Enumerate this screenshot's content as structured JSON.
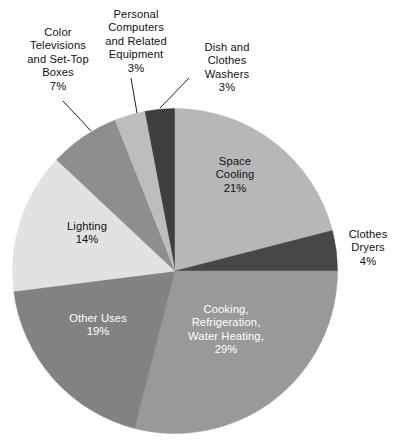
{
  "chart_data": {
    "type": "pie",
    "title": "",
    "subtitle": "",
    "xlabel": "",
    "ylabel": "",
    "legend_position": "none",
    "grid": false,
    "unit": "%",
    "total": 100,
    "categories": [
      "Dish and Clothes Washers",
      "Space Cooling",
      "Clothes Dryers",
      "Cooking, Refrigeration, Water Heating,",
      "Other Uses",
      "Lighting",
      "Color Televisions and Set-Top Boxes",
      "Personal Computers and Related Equipment"
    ],
    "values": [
      3,
      21,
      4,
      29,
      19,
      14,
      7,
      3
    ],
    "slices": [
      {
        "name": "dish-and-clothes-washers",
        "value": 3,
        "value_label": "3%",
        "color": "#3f3f3f",
        "label_lines": [
          "Dish and",
          "Clothes",
          "Washers",
          "3%"
        ],
        "label_placement": "external",
        "text_color": "#111111"
      },
      {
        "name": "space-cooling",
        "value": 21,
        "value_label": "21%",
        "color": "#b7b7b7",
        "label_lines": [
          "Space",
          "Cooling",
          "21%"
        ],
        "label_placement": "internal",
        "text_color": "#111111"
      },
      {
        "name": "clothes-dryers",
        "value": 4,
        "value_label": "4%",
        "color": "#474747",
        "label_lines": [
          "Clothes",
          "Dryers",
          "4%"
        ],
        "label_placement": "external",
        "text_color": "#111111"
      },
      {
        "name": "cooking-refrigeration-water-heating",
        "value": 29,
        "value_label": "29%",
        "color": "#999999",
        "label_lines": [
          "Cooking,",
          "Refrigeration,",
          "Water Heating,",
          "29%"
        ],
        "label_placement": "internal",
        "text_color": "#ffffff"
      },
      {
        "name": "other-uses",
        "value": 19,
        "value_label": "19%",
        "color": "#828282",
        "label_lines": [
          "Other Uses",
          "19%"
        ],
        "label_placement": "internal",
        "text_color": "#ffffff"
      },
      {
        "name": "lighting",
        "value": 14,
        "value_label": "14%",
        "color": "#e2e2e2",
        "label_lines": [
          "Lighting",
          "14%"
        ],
        "label_placement": "internal",
        "text_color": "#111111"
      },
      {
        "name": "color-televisions-and-set-top-boxes",
        "value": 7,
        "value_label": "7%",
        "color": "#8e8e8e",
        "label_lines": [
          "Color",
          "Televisions",
          "and Set-Top",
          "Boxes",
          "7%"
        ],
        "label_placement": "external",
        "text_color": "#111111"
      },
      {
        "name": "personal-computers-and-related-equipment",
        "value": 3,
        "value_label": "3%",
        "color": "#bdbdbd",
        "label_lines": [
          "Personal",
          "Computers",
          "and Related",
          "Equipment",
          "3%"
        ],
        "label_placement": "external",
        "text_color": "#111111"
      }
    ]
  },
  "labels": {
    "color_televisions": {
      "l1": "Color",
      "l2": "Televisions",
      "l3": "and Set-Top",
      "l4": "Boxes",
      "l5": "7%"
    },
    "personal_computers": {
      "l1": "Personal",
      "l2": "Computers",
      "l3": "and Related",
      "l4": "Equipment",
      "l5": "3%"
    },
    "dish_washers": {
      "l1": "Dish and",
      "l2": "Clothes",
      "l3": "Washers",
      "l4": "3%"
    },
    "clothes_dryers": {
      "l1": "Clothes",
      "l2": "Dryers",
      "l3": "4%"
    },
    "space_cooling": {
      "l1": "Space",
      "l2": "Cooling",
      "l3": "21%"
    },
    "cooking": {
      "l1": "Cooking,",
      "l2": "Refrigeration,",
      "l3": "Water Heating,",
      "l4": "29%"
    },
    "other_uses": {
      "l1": "Other Uses",
      "l2": "19%"
    },
    "lighting": {
      "l1": "Lighting",
      "l2": "14%"
    }
  }
}
